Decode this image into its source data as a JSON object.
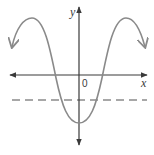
{
  "diagram": {
    "type": "function-graph",
    "axes": {
      "x_label": "x",
      "y_label": "y",
      "origin_label": "0"
    },
    "curve": {
      "description": "inverted cosine-like wave with local maxima on each side and a minimum below the origin, arrows at both ends",
      "color": "#8a8a8a"
    },
    "dashed_line": {
      "description": "horizontal dashed line below the x-axis",
      "color": "#8a8a8a"
    },
    "colors": {
      "axis": "#3a3a3a",
      "curve": "#8a8a8a",
      "background": "#ffffff"
    }
  }
}
